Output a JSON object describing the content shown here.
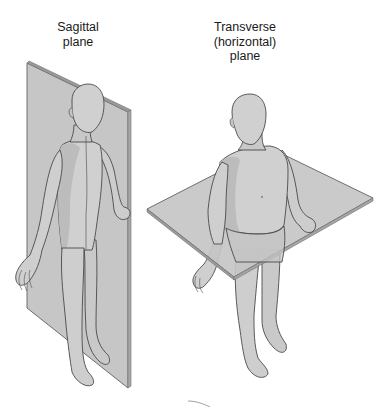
{
  "figures": [
    {
      "id": "sagittal",
      "label": "Sagittal\nplane",
      "plane_type": "sagittal"
    },
    {
      "id": "transverse",
      "label": "Transverse\n(horizontal)\nplane",
      "plane_type": "transverse"
    }
  ],
  "colors": {
    "background": "#ffffff",
    "plane_fill": "#c6c6c6",
    "plane_edge": "#6e6e6e",
    "body_fill": "#d0d0d0",
    "body_shadow": "#b4b4b4",
    "outline": "#4a4a4a",
    "text": "#1a1a1a"
  }
}
